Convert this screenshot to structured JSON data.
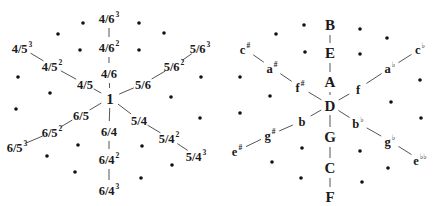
{
  "left_lattice": {
    "center": {
      "label": "1",
      "x": 110,
      "y": 98
    },
    "axes": [
      {
        "name": "up",
        "nodes": [
          {
            "base": "4/6",
            "sup": "",
            "x": 109,
            "y": 73
          },
          {
            "base": "4/6",
            "sup": "2",
            "x": 109,
            "y": 47
          },
          {
            "base": "4/6",
            "sup": "3",
            "x": 109,
            "y": 18
          }
        ]
      },
      {
        "name": "upper-left",
        "nodes": [
          {
            "base": "4/5",
            "sup": "",
            "x": 85,
            "y": 84
          },
          {
            "base": "4/5",
            "sup": "2",
            "x": 52,
            "y": 66
          },
          {
            "base": "4/5",
            "sup": "3",
            "x": 22,
            "y": 48
          }
        ]
      },
      {
        "name": "upper-right",
        "nodes": [
          {
            "base": "5/6",
            "sup": "",
            "x": 143,
            "y": 84
          },
          {
            "base": "5/6",
            "sup": "2",
            "x": 174,
            "y": 66
          },
          {
            "base": "5/6",
            "sup": "3",
            "x": 200,
            "y": 48
          }
        ]
      },
      {
        "name": "lower-left",
        "nodes": [
          {
            "base": "6/5",
            "sup": "",
            "x": 81,
            "y": 115
          },
          {
            "base": "6/5",
            "sup": "2",
            "x": 52,
            "y": 132
          },
          {
            "base": "6/5",
            "sup": "3",
            "x": 17,
            "y": 147
          }
        ]
      },
      {
        "name": "down",
        "nodes": [
          {
            "base": "6/4",
            "sup": "",
            "x": 109,
            "y": 131
          },
          {
            "base": "6/4",
            "sup": "2",
            "x": 109,
            "y": 159
          },
          {
            "base": "6/4",
            "sup": "3",
            "x": 109,
            "y": 190
          }
        ]
      },
      {
        "name": "lower-right",
        "nodes": [
          {
            "base": "5/4",
            "sup": "",
            "x": 139,
            "y": 120
          },
          {
            "base": "5/4",
            "sup": "2",
            "x": 169,
            "y": 138
          },
          {
            "base": "5/4",
            "sup": "3",
            "x": 196,
            "y": 156
          }
        ]
      }
    ],
    "dots": [
      [
        83,
        23
      ],
      [
        139,
        23
      ],
      [
        58,
        34
      ],
      [
        164,
        33
      ],
      [
        80,
        50
      ],
      [
        139,
        50
      ],
      [
        18,
        77
      ],
      [
        201,
        77
      ],
      [
        50,
        93
      ],
      [
        171,
        97
      ],
      [
        16,
        109
      ],
      [
        200,
        118
      ],
      [
        78,
        145
      ],
      [
        142,
        146
      ],
      [
        47,
        156
      ],
      [
        172,
        165
      ],
      [
        75,
        172
      ],
      [
        141,
        178
      ]
    ]
  },
  "right_lattice": {
    "center": {
      "label": "D",
      "x": 330,
      "y": 105
    },
    "axes": [
      {
        "name": "up",
        "nodes": [
          {
            "base": "A",
            "sup": "",
            "x": 330,
            "y": 82
          },
          {
            "base": "E",
            "sup": "",
            "x": 330,
            "y": 53
          },
          {
            "base": "B",
            "sup": "",
            "x": 330,
            "y": 25
          }
        ]
      },
      {
        "name": "upper-left",
        "nodes": [
          {
            "base": "f",
            "sup": "#",
            "x": 300,
            "y": 87
          },
          {
            "base": "a",
            "sup": "#",
            "x": 272,
            "y": 68
          },
          {
            "base": "c",
            "sup": "#",
            "x": 245,
            "y": 49
          }
        ]
      },
      {
        "name": "upper-right",
        "nodes": [
          {
            "base": "f",
            "sup": "",
            "x": 358,
            "y": 89
          },
          {
            "base": "a",
            "sup": "♭",
            "x": 390,
            "y": 68
          },
          {
            "base": "c",
            "sup": "♭",
            "x": 420,
            "y": 49
          }
        ]
      },
      {
        "name": "lower-left",
        "nodes": [
          {
            "base": "b",
            "sup": "",
            "x": 302,
            "y": 121
          },
          {
            "base": "g",
            "sup": "#",
            "x": 270,
            "y": 135
          },
          {
            "base": "e",
            "sup": "#",
            "x": 237,
            "y": 151
          }
        ]
      },
      {
        "name": "down",
        "nodes": [
          {
            "base": "G",
            "sup": "",
            "x": 330,
            "y": 137
          },
          {
            "base": "C",
            "sup": "",
            "x": 330,
            "y": 168
          },
          {
            "base": "F",
            "sup": "",
            "x": 330,
            "y": 197
          }
        ]
      },
      {
        "name": "lower-right",
        "nodes": [
          {
            "base": "b",
            "sup": "♭",
            "x": 358,
            "y": 123
          },
          {
            "base": "g",
            "sup": "♭",
            "x": 390,
            "y": 141
          },
          {
            "base": "e",
            "sup": "♭♭",
            "x": 420,
            "y": 160
          }
        ]
      }
    ],
    "dots": [
      [
        304,
        25
      ],
      [
        360,
        29
      ],
      [
        276,
        34
      ],
      [
        387,
        38
      ],
      [
        305,
        52
      ],
      [
        360,
        54
      ],
      [
        240,
        77
      ],
      [
        420,
        80
      ],
      [
        270,
        96
      ],
      [
        391,
        102
      ],
      [
        240,
        113
      ],
      [
        421,
        118
      ],
      [
        302,
        148
      ],
      [
        360,
        151
      ],
      [
        272,
        162
      ],
      [
        388,
        168
      ],
      [
        301,
        178
      ],
      [
        362,
        182
      ]
    ]
  }
}
